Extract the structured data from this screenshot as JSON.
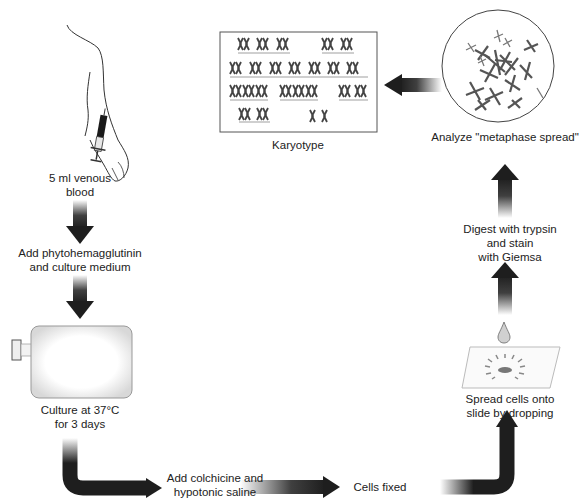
{
  "steps": {
    "blood": {
      "line1": "5 ml venous",
      "line2": "blood"
    },
    "pha": {
      "line1": "Add phytohemagglutinin",
      "line2": "and culture medium"
    },
    "culture": {
      "line1": "Culture at 37°C",
      "line2": "for 3 days"
    },
    "colchicine": {
      "line1": "Add colchicine and",
      "line2": "hypotonic saline"
    },
    "fixed": {
      "line1": "Cells fixed"
    },
    "spread": {
      "line1": "Spread cells onto",
      "line2": "slide by dropping"
    },
    "digest": {
      "line1": "Digest with trypsin",
      "line2": "and stain",
      "line3": "with Giemsa"
    },
    "analyze": {
      "line1": "Analyze \"metaphase spread\""
    },
    "karyotype": {
      "line1": "Karyotype"
    }
  },
  "colors": {
    "arrow": "#1e1e1e",
    "outline": "#555555",
    "chromosome": "#444444"
  }
}
